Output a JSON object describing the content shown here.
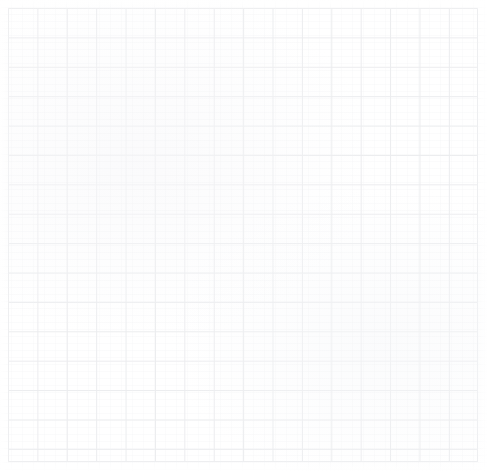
{
  "document": {
    "kind": "graph-paper",
    "description": "Blank ruled graph paper sheet",
    "content_text": "",
    "has_annotations": false,
    "has_text": false
  },
  "canvas": {
    "width": 488,
    "height": 472,
    "background_color": "#ffffff"
  },
  "grid": {
    "origin_x": 8,
    "origin_y": 8,
    "width": 470,
    "height": 454,
    "cell_size": 29.4,
    "columns": 16,
    "rows": 15,
    "line_color": "#ebecee",
    "line_width": 1,
    "border_color": "#ebecee",
    "visible": true
  },
  "artifacts": {
    "scan_banding_color": "#eeeff1",
    "scan_streak_color": "#f0f1f3",
    "paper_tone_color": "#f8f8fa",
    "edge_fade_color": "#ffffff"
  }
}
